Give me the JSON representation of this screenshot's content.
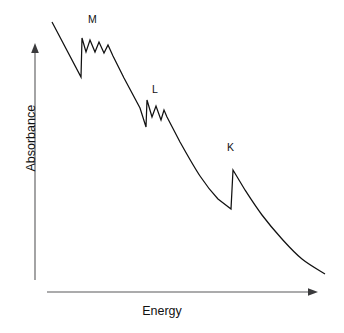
{
  "chart_data": {
    "type": "line",
    "title": "",
    "subtitle": "",
    "xlabel": "Energy",
    "ylabel": "Absorbance",
    "grid": false,
    "legend": null,
    "axis_style": "arrow-axes-no-ticks",
    "xlim": [
      0,
      1
    ],
    "ylim": [
      0,
      1
    ],
    "xticks": [],
    "yticks": [],
    "annotations": [
      {
        "label": "M",
        "x_px": 92,
        "y_px": 20
      },
      {
        "label": "L",
        "x_px": 156,
        "y_px": 90
      },
      {
        "label": "K",
        "x_px": 231,
        "y_px": 148
      }
    ],
    "series": [
      {
        "name": "Absorbance",
        "color": "#111111",
        "points_px": [
          [
            52,
            22
          ],
          [
            81,
            77
          ],
          [
            82,
            38
          ],
          [
            86,
            52
          ],
          [
            90,
            40
          ],
          [
            95,
            52
          ],
          [
            99,
            42
          ],
          [
            104,
            53
          ],
          [
            108,
            45
          ],
          [
            113,
            56
          ],
          [
            124,
            78
          ],
          [
            140,
            108
          ],
          [
            146,
            127
          ],
          [
            147,
            100
          ],
          [
            152,
            117
          ],
          [
            156,
            106
          ],
          [
            161,
            120
          ],
          [
            164,
            110
          ],
          [
            167,
            117
          ],
          [
            180,
            142
          ],
          [
            200,
            176
          ],
          [
            218,
            199
          ],
          [
            231,
            209
          ],
          [
            233,
            170
          ],
          [
            245,
            190
          ],
          [
            262,
            215
          ],
          [
            282,
            239
          ],
          [
            302,
            259
          ],
          [
            325,
            274
          ]
        ]
      }
    ],
    "edges": [
      {
        "name": "M",
        "edge_type": "absorption-edge",
        "jump_direction": "up",
        "fine_structure_peaks": 3,
        "position_px": 81
      },
      {
        "name": "L",
        "edge_type": "absorption-edge",
        "jump_direction": "up",
        "fine_structure_peaks": 2,
        "position_px": 146
      },
      {
        "name": "K",
        "edge_type": "absorption-edge",
        "jump_direction": "up",
        "fine_structure_peaks": 0,
        "position_px": 231
      }
    ]
  },
  "axes": {
    "y_axis": {
      "x_px": 35,
      "top_px": 44,
      "bottom_px": 280,
      "arrow": "up",
      "color": "#58585a"
    },
    "x_axis": {
      "y_px": 292,
      "left_px": 47,
      "right_px": 318,
      "arrow": "right",
      "color": "#58585a"
    }
  },
  "labels": {
    "y_axis_title": "Absorbance",
    "x_axis_title": "Energy",
    "edge_m": "M",
    "edge_l": "L",
    "edge_k": "K"
  }
}
